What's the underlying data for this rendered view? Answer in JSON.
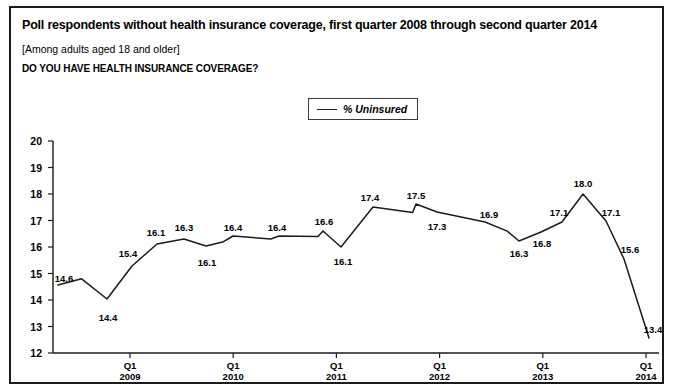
{
  "header": {
    "title": "Poll respondents without health insurance coverage, first quarter 2008 through second quarter 2014",
    "subtitle": "[Among adults aged 18 and older]",
    "question": "DO YOU HAVE HEALTH INSURANCE COVERAGE?"
  },
  "legend": {
    "label": "% Uninsured",
    "swatch_color": "#1b1b1b"
  },
  "footnote": {
    "text": "partial cut-off source line"
  },
  "chart_data": {
    "type": "line",
    "title": "Poll respondents without health insurance coverage, first quarter 2008 through second quarter 2014",
    "subtitle": "[Among adults aged 18 and older]",
    "xlabel": "",
    "ylabel": "",
    "ylim": [
      12,
      20
    ],
    "ytick_step": 1,
    "grid": false,
    "legend_position": "top-center",
    "series_name": "% Uninsured",
    "line_color": "#1b1b1b",
    "yticks": [
      "20",
      "19",
      "18",
      "17",
      "16",
      "15",
      "14",
      "13",
      "12"
    ],
    "xticks": [
      {
        "q": "Q1",
        "year": "2009"
      },
      {
        "q": "Q1",
        "year": "2010"
      },
      {
        "q": "Q1",
        "year": "2011"
      },
      {
        "q": "Q1",
        "year": "2012"
      },
      {
        "q": "Q1",
        "year": "2013"
      },
      {
        "q": "Q1",
        "year": "2014"
      }
    ],
    "x": [
      "Q1 2008",
      "Q2 2008",
      "Q3 2008",
      "Q4 2008",
      "Q1 2009",
      "Q2 2009",
      "Q3 2009",
      "Q4 2009",
      "Q1 2010",
      "Q2 2010",
      "Q3 2010",
      "Q4 2010",
      "Q1 2011",
      "Q2 2011",
      "Q3 2011",
      "Q4 2011",
      "Q1 2012",
      "Q2 2012",
      "Q3 2012",
      "Q4 2012",
      "Q1 2013",
      "Q2 2013",
      "Q3 2013",
      "Q4 2013",
      "Q1 2014",
      "Q2 2014"
    ],
    "values": [
      14.6,
      14.8,
      14.4,
      15.4,
      16.1,
      16.3,
      16.1,
      16.2,
      16.4,
      16.3,
      16.4,
      16.4,
      16.6,
      16.1,
      17.4,
      17.3,
      17.5,
      17.4,
      16.9,
      16.6,
      16.3,
      16.8,
      17.1,
      18.0,
      17.1,
      15.6
    ],
    "labeled_points": [
      {
        "label": "14.6",
        "index": 0,
        "px": 47,
        "py": 277,
        "lx": 53,
        "ly": 270
      },
      {
        "label": "14.4",
        "index": 2,
        "px": 96,
        "py": 291,
        "lx": 97,
        "ly": 309
      },
      {
        "label": "15.4",
        "index": 3,
        "px": 121,
        "py": 258,
        "lx": 117,
        "ly": 245
      },
      {
        "label": "16.1",
        "index": 4,
        "px": 146,
        "py": 236,
        "lx": 145,
        "ly": 224
      },
      {
        "label": "16.3",
        "index": 5,
        "px": 173,
        "py": 231,
        "lx": 173,
        "ly": 219
      },
      {
        "label": "16.1",
        "index": 6,
        "px": 195,
        "py": 238,
        "lx": 196,
        "ly": 254
      },
      {
        "label": "16.4",
        "index": 8,
        "px": 222,
        "py": 228,
        "lx": 222,
        "ly": 219
      },
      {
        "label": "16.4",
        "index": 10,
        "px": 268,
        "py": 228,
        "lx": 266,
        "ly": 219
      },
      {
        "label": "16.6",
        "index": 12,
        "px": 312,
        "py": 223,
        "lx": 313,
        "ly": 213
      },
      {
        "label": "16.1",
        "index": 13,
        "px": 330,
        "py": 239,
        "lx": 332,
        "ly": 253
      },
      {
        "label": "17.4",
        "index": 14,
        "px": 362,
        "py": 199,
        "lx": 359,
        "ly": 189
      },
      {
        "label": "17.5",
        "index": 16,
        "px": 405,
        "py": 196,
        "lx": 405,
        "ly": 187
      },
      {
        "label": "17.3",
        "index": 17,
        "px": 426,
        "py": 204,
        "lx": 426,
        "ly": 218
      },
      {
        "label": "16.9",
        "index": 18,
        "px": 474,
        "py": 214,
        "lx": 478,
        "ly": 206
      },
      {
        "label": "16.3",
        "index": 20,
        "px": 508,
        "py": 233,
        "lx": 508,
        "ly": 245
      },
      {
        "label": "16.8",
        "index": 21,
        "px": 530,
        "py": 224,
        "lx": 531,
        "ly": 235
      },
      {
        "label": "17.1",
        "index": 22,
        "px": 551,
        "py": 214,
        "lx": 548,
        "ly": 204
      },
      {
        "label": "18.0",
        "index": 23,
        "px": 572,
        "py": 186,
        "lx": 572,
        "ly": 175
      },
      {
        "label": "17.1",
        "index": 24,
        "px": 595,
        "py": 213,
        "lx": 600,
        "ly": 204
      },
      {
        "label": "15.6",
        "index": 25,
        "px": 613,
        "py": 251,
        "lx": 619,
        "ly": 241
      },
      {
        "label": "13.4",
        "index": 26,
        "px": 638,
        "py": 330,
        "lx": 642,
        "ly": 321
      }
    ],
    "annotations": []
  }
}
